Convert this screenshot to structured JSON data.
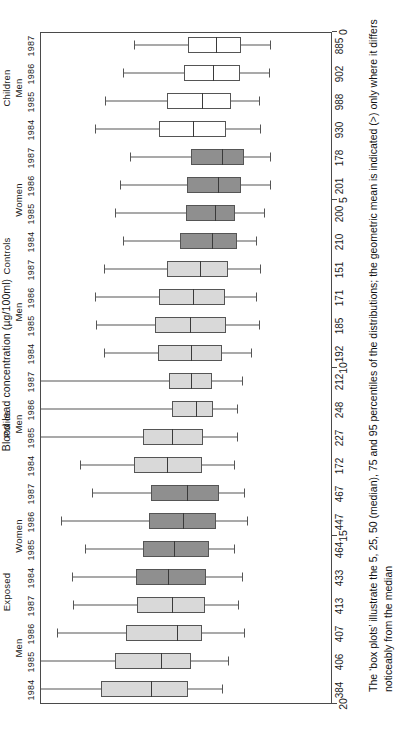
{
  "chart_data": {
    "type": "box",
    "title": "",
    "xlabel": "",
    "ylabel": "Blood lead concentration (µg/100ml)",
    "ylim": [
      0,
      20
    ],
    "y_reversed": true,
    "yticks": [
      20,
      15,
      10,
      5,
      0
    ],
    "grid": false,
    "legend": "none",
    "orientation": "horizontal-rows",
    "percentiles": [
      5,
      25,
      50,
      75,
      95
    ],
    "group_levels_1": [
      {
        "label": "Exposed",
        "span": [
          0,
          7
        ]
      },
      {
        "label": "Police",
        "span": [
          8,
          11
        ]
      },
      {
        "label": "Controls",
        "span": [
          12,
          19
        ]
      },
      {
        "label": "Children",
        "span": [
          20,
          23
        ]
      }
    ],
    "group_levels_2": [
      {
        "label": "Men",
        "span": [
          0,
          3
        ]
      },
      {
        "label": "Women",
        "span": [
          4,
          7
        ]
      },
      {
        "label": "Men",
        "span": [
          8,
          11
        ]
      },
      {
        "label": "Men",
        "span": [
          12,
          15
        ]
      },
      {
        "label": "Women",
        "span": [
          16,
          19
        ]
      },
      {
        "label": "Men",
        "span": [
          20,
          23
        ]
      }
    ],
    "categories": [
      "1984",
      "1985",
      "1986",
      "1987",
      "1984",
      "1985",
      "1986",
      "1987",
      "1984",
      "1985",
      "1986",
      "1987",
      "1984",
      "1985",
      "1986",
      "1987",
      "1984",
      "1985",
      "1986",
      "1987",
      "1984",
      "1985",
      "1986",
      "1987"
    ],
    "sample_sizes": [
      384,
      406,
      407,
      413,
      433,
      464,
      447,
      467,
      172,
      227,
      248,
      212,
      192,
      185,
      171,
      151,
      210,
      200,
      201,
      178,
      930,
      988,
      902,
      885
    ],
    "fills": [
      "light",
      "light",
      "light",
      "light",
      "dark",
      "dark",
      "dark",
      "dark",
      "light",
      "light",
      "light",
      "light",
      "light",
      "light",
      "light",
      "light",
      "dark",
      "dark",
      "dark",
      "dark",
      "white",
      "white",
      "white",
      "white"
    ],
    "boxes": [
      {
        "p5": 7.6,
        "p25": 9.9,
        "p50": 12.5,
        "p75": 15.9,
        "p95": 20.0
      },
      {
        "p5": 7.2,
        "p25": 9.7,
        "p50": 11.8,
        "p75": 14.9,
        "p95": 20.0
      },
      {
        "p5": 6.1,
        "p25": 9.0,
        "p50": 10.7,
        "p75": 14.2,
        "p95": 18.9
      },
      {
        "p5": 6.5,
        "p25": 8.8,
        "p50": 11.0,
        "p75": 13.4,
        "p95": 17.8
      },
      {
        "p5": 6.2,
        "p25": 8.7,
        "p50": 11.3,
        "p75": 13.5,
        "p95": 17.9
      },
      {
        "p5": 6.8,
        "p25": 8.5,
        "p50": 10.9,
        "p75": 13.0,
        "p95": 17.0
      },
      {
        "p5": 5.9,
        "p25": 8.0,
        "p50": 10.3,
        "p75": 12.6,
        "p95": 18.6
      },
      {
        "p5": 6.1,
        "p25": 7.8,
        "p50": 10.0,
        "p75": 12.5,
        "p95": 16.5
      },
      {
        "p5": 6.8,
        "p25": 9.0,
        "p50": 11.4,
        "p75": 13.6,
        "p95": 17.3
      },
      {
        "p5": 6.6,
        "p25": 8.9,
        "p50": 11.0,
        "p75": 13.0,
        "p95": 20.0
      },
      {
        "p5": 6.6,
        "p25": 8.2,
        "p50": 9.4,
        "p75": 11.0,
        "p95": 20.0
      },
      {
        "p5": 6.2,
        "p25": 8.3,
        "p50": 9.7,
        "p75": 11.2,
        "p95": 20.0
      },
      {
        "p5": 5.6,
        "p25": 7.6,
        "p50": 9.7,
        "p75": 12.0,
        "p95": 15.7
      },
      {
        "p5": 5.1,
        "p25": 7.3,
        "p50": 9.8,
        "p75": 12.2,
        "p95": 16.2
      },
      {
        "p5": 5.3,
        "p25": 7.4,
        "p50": 9.6,
        "p75": 11.9,
        "p95": 16.3
      },
      {
        "p5": 5.0,
        "p25": 7.2,
        "p50": 9.1,
        "p75": 11.4,
        "p95": 15.7
      },
      {
        "p5": 5.3,
        "p25": 6.6,
        "p50": 8.3,
        "p75": 10.5,
        "p95": 14.4
      },
      {
        "p5": 4.7,
        "p25": 6.7,
        "p50": 8.1,
        "p75": 10.1,
        "p95": 14.9
      },
      {
        "p5": 4.3,
        "p25": 6.3,
        "p50": 7.9,
        "p75": 10.0,
        "p95": 14.6
      },
      {
        "p5": 4.3,
        "p25": 6.1,
        "p50": 7.6,
        "p75": 9.7,
        "p95": 13.9
      },
      {
        "p5": 5.0,
        "p25": 7.3,
        "p50": 9.6,
        "p75": 11.9,
        "p95": 16.3
      },
      {
        "p5": 5.1,
        "p25": 7.0,
        "p50": 9.0,
        "p75": 11.4,
        "p95": 15.6
      },
      {
        "p5": 4.4,
        "p25": 6.4,
        "p50": 8.2,
        "p75": 10.2,
        "p95": 14.4
      },
      {
        "p5": 4.3,
        "p25": 6.3,
        "p50": 8.0,
        "p75": 9.9,
        "p95": 13.6
      }
    ],
    "colors": {
      "light": "#d9d9d9",
      "dark": "#8f8f8f",
      "white": "#ffffff",
      "outline": "#555555",
      "frame": "#4a4a4a"
    }
  },
  "caption": {
    "text": "The ‘box plots’ illustrate the 5, 25, 50 (median), 75 and 95 percentiles of the distributions; the geometric mean is indicated (>) only where it differs noticeably from the median"
  }
}
